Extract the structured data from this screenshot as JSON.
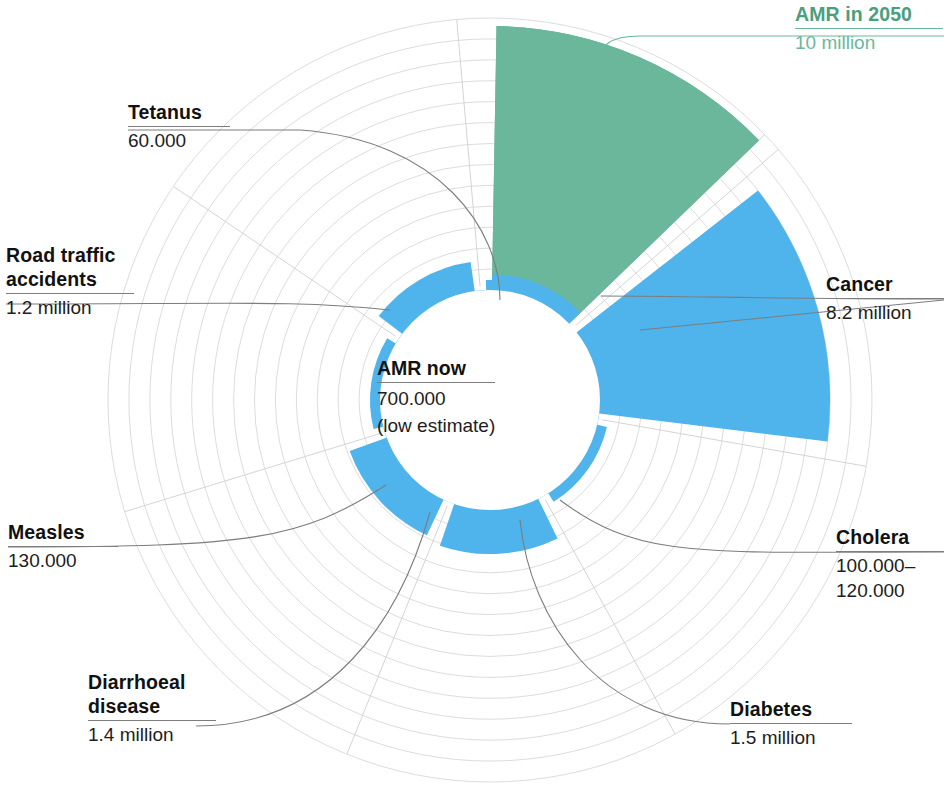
{
  "chart_data": {
    "type": "pie",
    "title": "",
    "subtitle": "",
    "variant": "polar-area-rose",
    "units": "annual deaths",
    "grid": true,
    "legend_position": "none",
    "center_annotation": {
      "caption": "AMR now",
      "value": "700.000",
      "note": "(low estimate)",
      "numeric": 700000
    },
    "radial_scale": {
      "inner_radius_value": 700000,
      "max_value": 10000000,
      "ring_count": 13
    },
    "categories": [
      "AMR in 2050",
      "Cancer",
      "Cholera",
      "Diabetes",
      "Diarrhoeal disease",
      "Measles",
      "Road traffic accidents",
      "Tetanus"
    ],
    "values": [
      10000000,
      8200000,
      110000,
      1500000,
      1400000,
      130000,
      1200000,
      60000
    ],
    "value_labels": [
      "10 million",
      "8.2 million",
      "100.000–120.000",
      "1.5 million",
      "1.4 million",
      "130.000",
      "1.2 million",
      "60.000"
    ],
    "colors": [
      "#6bb79c",
      "#4fb3ec",
      "#4fb3ec",
      "#4fb3ec",
      "#4fb3ec",
      "#4fb3ec",
      "#4fb3ec",
      "#4fb3ec"
    ],
    "accent_green": "#6bb79c",
    "accent_blue": "#4fb3ec",
    "grid_color": "#d8d8d8",
    "segments": [
      {
        "id": "amr-2050",
        "label": "AMR in 2050",
        "value_label": "10 million",
        "value": 10000000,
        "color": "#6bb79c",
        "a0": -89,
        "a1": -44
      },
      {
        "id": "cancer",
        "label": "Cancer",
        "value_label": "8.2 million",
        "value": 8200000,
        "color": "#4fb3ec",
        "a0": -38,
        "a1": 7
      },
      {
        "id": "cholera",
        "label": "Cholera",
        "value_label": "100.000–120.000",
        "value": 110000,
        "color": "#4fb3ec",
        "a0": 13,
        "a1": 58
      },
      {
        "id": "diabetes",
        "label": "Diabetes",
        "value_label": "1.5 million",
        "value": 1500000,
        "color": "#4fb3ec",
        "a0": 64,
        "a1": 109
      },
      {
        "id": "diarrhoeal",
        "label": "Diarrhoeal disease",
        "value_label": "1.4 million",
        "value": 1400000,
        "color": "#4fb3ec",
        "a0": 115,
        "a1": 160
      },
      {
        "id": "measles",
        "label": "Measles",
        "value_label": "130.000",
        "value": 130000,
        "color": "#4fb3ec",
        "a0": 166,
        "a1": 211
      },
      {
        "id": "road-traffic",
        "label": "Road traffic accidents",
        "value_label": "1.2 million",
        "value": 1200000,
        "color": "#4fb3ec",
        "a0": 217,
        "a1": 262
      },
      {
        "id": "tetanus",
        "label": "Tetanus",
        "value_label": "60.000",
        "value": 60000,
        "color": "#4fb3ec",
        "a0": 268,
        "a1": 313
      }
    ]
  },
  "labels": {
    "amr_2050": {
      "caption": "AMR in 2050",
      "value": "10 million"
    },
    "cancer": {
      "caption": "Cancer",
      "value": "8.2 million"
    },
    "cholera": {
      "caption": "Cholera",
      "value_line1": "100.000–",
      "value_line2": "120.000"
    },
    "diabetes": {
      "caption": "Diabetes",
      "value": "1.5 million"
    },
    "diarrhoeal": {
      "caption_line1": "Diarrhoeal",
      "caption_line2": "disease",
      "value": "1.4 million"
    },
    "measles": {
      "caption": "Measles",
      "value": "130.000"
    },
    "road_traffic": {
      "caption_line1": "Road traffic",
      "caption_line2": "accidents",
      "value": "1.2 million"
    },
    "tetanus": {
      "caption": "Tetanus",
      "value": "60.000"
    }
  },
  "center": {
    "caption": "AMR now",
    "value": "700.000",
    "note": "(low estimate)"
  }
}
